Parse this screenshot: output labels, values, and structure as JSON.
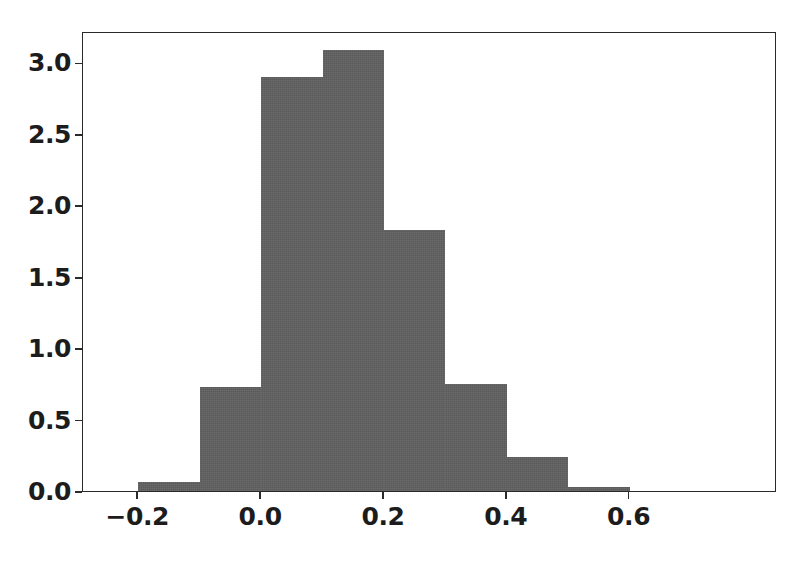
{
  "chart_data": {
    "type": "bar",
    "subtype": "histogram",
    "title": "",
    "subtitle": "",
    "xlabel": "",
    "ylabel": "",
    "bar_color": "#606060",
    "edge_color": "#606060",
    "grid": false,
    "legend": null,
    "bin_width": 0.1,
    "bin_edges": [
      -0.2,
      -0.1,
      0.0,
      0.1,
      0.2,
      0.3,
      0.4,
      0.5,
      0.6
    ],
    "categories": [
      "-0.2 to -0.1",
      "-0.1 to 0.0",
      "0.0 to 0.1",
      "0.1 to 0.2",
      "0.2 to 0.3",
      "0.3 to 0.4",
      "0.4 to 0.5",
      "0.5 to 0.6"
    ],
    "values": [
      0.06,
      0.73,
      2.9,
      3.09,
      1.83,
      0.75,
      0.24,
      0.03
    ],
    "xlim": [
      -0.29,
      0.84
    ],
    "ylim": [
      0.0,
      3.22
    ],
    "xticks": [
      -0.2,
      0.0,
      0.2,
      0.4,
      0.6
    ],
    "yticks": [
      0.0,
      0.5,
      1.0,
      1.5,
      2.0,
      2.5,
      3.0
    ],
    "xtick_labels": [
      "−0.2",
      "0.0",
      "0.2",
      "0.4",
      "0.6"
    ],
    "ytick_labels": [
      "0.0",
      "0.5",
      "1.0",
      "1.5",
      "2.0",
      "2.5",
      "3.0"
    ]
  }
}
